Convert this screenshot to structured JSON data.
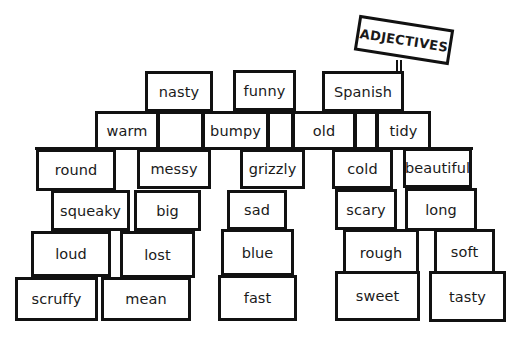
{
  "sign": {
    "label": "ADJECTIVES"
  },
  "wall": {
    "top_row": [
      {
        "label": "nasty",
        "x": 145,
        "y": 71,
        "w": 68,
        "h": 41
      },
      {
        "label": "funny",
        "x": 233,
        "y": 70,
        "w": 63,
        "h": 41
      },
      {
        "label": "Spanish",
        "x": 322,
        "y": 71,
        "w": 82,
        "h": 41
      }
    ],
    "beam_row": [
      {
        "label": "warm",
        "x": 95,
        "y": 111,
        "w": 64,
        "h": 39
      },
      {
        "label": "",
        "x": 157,
        "y": 111,
        "w": 47,
        "h": 39
      },
      {
        "label": "bumpy",
        "x": 202,
        "y": 111,
        "w": 67,
        "h": 39
      },
      {
        "label": "",
        "x": 267,
        "y": 111,
        "w": 27,
        "h": 39
      },
      {
        "label": "old",
        "x": 292,
        "y": 111,
        "w": 64,
        "h": 39
      },
      {
        "label": "",
        "x": 354,
        "y": 111,
        "w": 24,
        "h": 39
      },
      {
        "label": "tidy",
        "x": 376,
        "y": 111,
        "w": 55,
        "h": 39
      }
    ],
    "row3": [
      {
        "label": "round",
        "x": 36,
        "y": 149,
        "w": 80,
        "h": 42
      },
      {
        "label": "messy",
        "x": 137,
        "y": 149,
        "w": 74,
        "h": 40
      },
      {
        "label": "grizzly",
        "x": 240,
        "y": 149,
        "w": 65,
        "h": 40
      },
      {
        "label": "cold",
        "x": 332,
        "y": 149,
        "w": 61,
        "h": 40
      },
      {
        "label": "beautiful",
        "x": 403,
        "y": 148,
        "w": 69,
        "h": 40
      }
    ],
    "row4": [
      {
        "label": "squeaky",
        "x": 51,
        "y": 190,
        "w": 79,
        "h": 41
      },
      {
        "label": "big",
        "x": 134,
        "y": 190,
        "w": 67,
        "h": 41
      },
      {
        "label": "sad",
        "x": 227,
        "y": 190,
        "w": 60,
        "h": 40
      },
      {
        "label": "scary",
        "x": 335,
        "y": 189,
        "w": 62,
        "h": 41
      },
      {
        "label": "long",
        "x": 405,
        "y": 188,
        "w": 72,
        "h": 43
      }
    ],
    "row5": [
      {
        "label": "loud",
        "x": 31,
        "y": 231,
        "w": 80,
        "h": 46
      },
      {
        "label": "lost",
        "x": 120,
        "y": 231,
        "w": 75,
        "h": 47
      },
      {
        "label": "blue",
        "x": 221,
        "y": 229,
        "w": 73,
        "h": 47
      },
      {
        "label": "rough",
        "x": 343,
        "y": 229,
        "w": 76,
        "h": 47
      },
      {
        "label": "soft",
        "x": 434,
        "y": 229,
        "w": 61,
        "h": 46
      }
    ],
    "row6": [
      {
        "label": "scruffy",
        "x": 15,
        "y": 277,
        "w": 83,
        "h": 44
      },
      {
        "label": "mean",
        "x": 101,
        "y": 277,
        "w": 90,
        "h": 44
      },
      {
        "label": "fast",
        "x": 218,
        "y": 275,
        "w": 79,
        "h": 46
      },
      {
        "label": "sweet",
        "x": 335,
        "y": 271,
        "w": 85,
        "h": 50
      },
      {
        "label": "tasty",
        "x": 429,
        "y": 271,
        "w": 77,
        "h": 51
      }
    ]
  },
  "colors": {
    "ink": "#111111",
    "background": "#ffffff"
  }
}
